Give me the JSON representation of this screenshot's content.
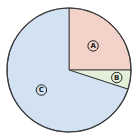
{
  "chart_data": {
    "type": "pie",
    "title": "",
    "categories": [
      "A",
      "B",
      "C"
    ],
    "values": [
      25,
      5,
      70
    ],
    "colors": [
      "#f3d3c9",
      "#e4efd9",
      "#d2e2f3"
    ],
    "start_angle_deg": 90,
    "direction": "clockwise",
    "labels_style": "circled letters",
    "legend": "none"
  },
  "style": {
    "outline_color": "#3a3a3a",
    "label_color": "#222222"
  }
}
